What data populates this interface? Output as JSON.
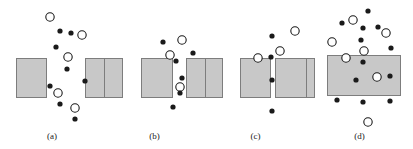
{
  "figure": {
    "width": 413,
    "height": 149,
    "background": "#ffffff"
  },
  "style": {
    "rect_fill": "#c8c8c8",
    "rect_stroke": "#7d7d7d",
    "rect_stroke_width": 1,
    "filled_dot_color": "#1a1a1a",
    "filled_dot_radius": 2.6,
    "open_circle_stroke": "#1a1a1a",
    "open_circle_fill": "#ffffff",
    "open_circle_radius": 4.2,
    "open_circle_stroke_width": 1.1,
    "label_color": "#1a1a1a",
    "label_font_size": 9
  },
  "panels": [
    {
      "id": "a",
      "label": "(a)",
      "x_offset": 0,
      "width": 104,
      "gap_label": "wide gap",
      "rects": [
        {
          "name": "left-barrier",
          "x": 16,
          "y": 58,
          "w": 30,
          "h": 39
        },
        {
          "name": "right-barrier",
          "x": 85,
          "y": 58,
          "w": 19,
          "h": 39
        }
      ],
      "filled_dots": [
        {
          "x": 60,
          "y": 31
        },
        {
          "x": 71,
          "y": 33
        },
        {
          "x": 56,
          "y": 47
        },
        {
          "x": 67,
          "y": 69
        },
        {
          "x": 50,
          "y": 86
        },
        {
          "x": 85,
          "y": 81
        },
        {
          "x": 60,
          "y": 104
        },
        {
          "x": 75,
          "y": 119
        }
      ],
      "open_circles": [
        {
          "x": 50,
          "y": 17
        },
        {
          "x": 82,
          "y": 35
        },
        {
          "x": 68,
          "y": 57
        },
        {
          "x": 58,
          "y": 93
        },
        {
          "x": 75,
          "y": 108
        }
      ]
    },
    {
      "id": "b",
      "label": "(b)",
      "x_offset": 104,
      "width": 101,
      "gap_label": "medium gap",
      "rects": [
        {
          "name": "left-barrier-far",
          "x": 0,
          "y": 58,
          "w": 18,
          "h": 39
        },
        {
          "name": "left-barrier",
          "x": 37,
          "y": 58,
          "w": 31,
          "h": 39
        },
        {
          "name": "right-barrier",
          "x": 82,
          "y": 58,
          "w": 19,
          "h": 39
        }
      ],
      "filled_dots": [
        {
          "x": 59,
          "y": 42
        },
        {
          "x": 89,
          "y": 53
        },
        {
          "x": 72,
          "y": 61
        },
        {
          "x": 78,
          "y": 78
        },
        {
          "x": 76,
          "y": 93
        },
        {
          "x": 69,
          "y": 107
        }
      ],
      "open_circles": [
        {
          "x": 78,
          "y": 40
        },
        {
          "x": 66,
          "y": 55
        },
        {
          "x": 76,
          "y": 87
        }
      ]
    },
    {
      "id": "c",
      "label": "(c)",
      "x_offset": 205,
      "width": 101,
      "gap_label": "narrow gap",
      "rects": [
        {
          "name": "left-barrier-far",
          "x": 0,
          "y": 58,
          "w": 17,
          "h": 39
        },
        {
          "name": "left-barrier",
          "x": 35,
          "y": 58,
          "w": 30,
          "h": 39
        },
        {
          "name": "right-barrier",
          "x": 70,
          "y": 58,
          "w": 31,
          "h": 39
        }
      ],
      "filled_dots": [
        {
          "x": 67,
          "y": 36
        },
        {
          "x": 66,
          "y": 57
        },
        {
          "x": 67,
          "y": 80
        },
        {
          "x": 67,
          "y": 111
        }
      ],
      "open_circles": [
        {
          "x": 90,
          "y": 31
        },
        {
          "x": 75,
          "y": 51
        },
        {
          "x": 53,
          "y": 58
        }
      ]
    },
    {
      "id": "d",
      "label": "(d)",
      "x_offset": 306,
      "width": 107,
      "gap_label": "no gap, single wide barrier",
      "rects": [
        {
          "name": "left-barrier-far",
          "x": 0,
          "y": 58,
          "w": 8,
          "h": 39
        },
        {
          "name": "wide-barrier",
          "x": 21,
          "y": 55,
          "w": 73,
          "h": 40
        }
      ],
      "filled_dots": [
        {
          "x": 62,
          "y": 11
        },
        {
          "x": 36,
          "y": 23
        },
        {
          "x": 57,
          "y": 28
        },
        {
          "x": 72,
          "y": 27
        },
        {
          "x": 55,
          "y": 40
        },
        {
          "x": 85,
          "y": 48
        },
        {
          "x": 57,
          "y": 62
        },
        {
          "x": 84,
          "y": 76
        },
        {
          "x": 50,
          "y": 80
        },
        {
          "x": 31,
          "y": 100
        },
        {
          "x": 57,
          "y": 102
        },
        {
          "x": 84,
          "y": 101
        }
      ],
      "open_circles": [
        {
          "x": 47,
          "y": 20
        },
        {
          "x": 80,
          "y": 33
        },
        {
          "x": 26,
          "y": 42
        },
        {
          "x": 58,
          "y": 51
        },
        {
          "x": 40,
          "y": 58
        },
        {
          "x": 71,
          "y": 77
        },
        {
          "x": 62,
          "y": 122
        }
      ]
    }
  ]
}
